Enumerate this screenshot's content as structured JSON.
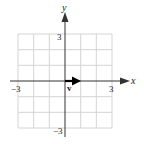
{
  "figure": {
    "type": "coordinate-plane-vector",
    "grid": {
      "xmin": -3,
      "xmax": 3,
      "ymin": -3,
      "ymax": 3,
      "step": 1,
      "color": "#d4d4d4"
    },
    "axes": {
      "x_label": "x",
      "y_label": "y",
      "color": "#333333"
    },
    "tick_labels": {
      "x_neg": "−3",
      "x_pos": "3",
      "y_pos": "3",
      "y_neg": "−3"
    },
    "vector": {
      "label": "v",
      "start": [
        0,
        0
      ],
      "end": [
        1,
        0
      ],
      "color": "#000000"
    }
  }
}
